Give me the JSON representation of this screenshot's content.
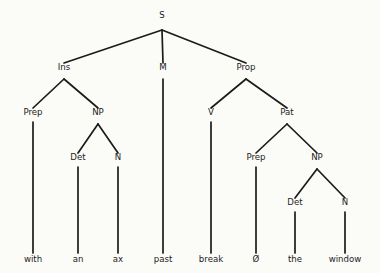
{
  "diagram": {
    "type": "syntax-tree",
    "background_color": "#fbfbf8",
    "line_color": "#1b1b1b",
    "text_color": "#1b1b1b",
    "sentence": "with an ax past break Ø the window",
    "nodes": [
      {
        "id": "s",
        "label": "S",
        "x": 162,
        "y": 18,
        "level": 0
      },
      {
        "id": "ins",
        "label": "Ins",
        "x": 64,
        "y": 70,
        "level": 1
      },
      {
        "id": "m",
        "label": "M",
        "x": 163,
        "y": 70,
        "level": 1
      },
      {
        "id": "prop",
        "label": "Prop",
        "x": 246,
        "y": 70,
        "level": 1
      },
      {
        "id": "prep1",
        "label": "Prep",
        "x": 33,
        "y": 115,
        "level": 2
      },
      {
        "id": "np1",
        "label": "NP",
        "x": 98,
        "y": 115,
        "level": 2
      },
      {
        "id": "v",
        "label": "V",
        "x": 211,
        "y": 115,
        "level": 2
      },
      {
        "id": "pat",
        "label": "Pat",
        "x": 287,
        "y": 115,
        "level": 2
      },
      {
        "id": "det1",
        "label": "Det",
        "x": 78,
        "y": 160,
        "level": 3
      },
      {
        "id": "n1",
        "label": "N",
        "x": 118,
        "y": 160,
        "level": 3
      },
      {
        "id": "prep2",
        "label": "Prep",
        "x": 256,
        "y": 160,
        "level": 3
      },
      {
        "id": "np2",
        "label": "NP",
        "x": 317,
        "y": 160,
        "level": 3
      },
      {
        "id": "det2",
        "label": "Det",
        "x": 295,
        "y": 205,
        "level": 4
      },
      {
        "id": "n2",
        "label": "N",
        "x": 345,
        "y": 205,
        "level": 4
      }
    ],
    "leaves": [
      {
        "id": "leaf-with",
        "label": "with",
        "x": 33,
        "y": 262,
        "parent": "prep1"
      },
      {
        "id": "leaf-an",
        "label": "an",
        "x": 78,
        "y": 262,
        "parent": "det1"
      },
      {
        "id": "leaf-ax",
        "label": "ax",
        "x": 118,
        "y": 262,
        "parent": "n1"
      },
      {
        "id": "leaf-past",
        "label": "past",
        "x": 163,
        "y": 262,
        "parent": "m"
      },
      {
        "id": "leaf-break",
        "label": "break",
        "x": 211,
        "y": 262,
        "parent": "v"
      },
      {
        "id": "leaf-null",
        "label": "Ø",
        "x": 256,
        "y": 262,
        "parent": "prep2"
      },
      {
        "id": "leaf-the",
        "label": "the",
        "x": 295,
        "y": 262,
        "parent": "det2"
      },
      {
        "id": "leaf-window",
        "label": "window",
        "x": 345,
        "y": 262,
        "parent": "n2"
      }
    ],
    "edges": [
      {
        "id": "edge-s-ins",
        "from": "s",
        "to": "ins",
        "x1": 162,
        "y1": 30,
        "x2": 64,
        "y2": 63
      },
      {
        "id": "edge-s-m",
        "from": "s",
        "to": "m",
        "x1": 162,
        "y1": 30,
        "x2": 163,
        "y2": 63
      },
      {
        "id": "edge-s-prop",
        "from": "s",
        "to": "prop",
        "x1": 162,
        "y1": 30,
        "x2": 246,
        "y2": 63
      },
      {
        "id": "edge-ins-prep1",
        "from": "ins",
        "to": "prep1",
        "x1": 64,
        "y1": 79,
        "x2": 33,
        "y2": 108
      },
      {
        "id": "edge-ins-np1",
        "from": "ins",
        "to": "np1",
        "x1": 64,
        "y1": 79,
        "x2": 98,
        "y2": 108
      },
      {
        "id": "edge-m-past",
        "from": "m",
        "to": "leaf-past",
        "x1": 163,
        "y1": 79,
        "x2": 163,
        "y2": 253
      },
      {
        "id": "edge-prop-v",
        "from": "prop",
        "to": "v",
        "x1": 246,
        "y1": 79,
        "x2": 211,
        "y2": 108
      },
      {
        "id": "edge-prop-pat",
        "from": "prop",
        "to": "pat",
        "x1": 246,
        "y1": 79,
        "x2": 287,
        "y2": 108
      },
      {
        "id": "edge-prep1-with",
        "from": "prep1",
        "to": "leaf-with",
        "x1": 33,
        "y1": 122,
        "x2": 33,
        "y2": 253
      },
      {
        "id": "edge-np1-det1",
        "from": "np1",
        "to": "det1",
        "x1": 98,
        "y1": 124,
        "x2": 78,
        "y2": 153
      },
      {
        "id": "edge-np1-n1",
        "from": "np1",
        "to": "n1",
        "x1": 98,
        "y1": 124,
        "x2": 118,
        "y2": 153
      },
      {
        "id": "edge-v-break",
        "from": "v",
        "to": "leaf-break",
        "x1": 211,
        "y1": 122,
        "x2": 211,
        "y2": 253
      },
      {
        "id": "edge-pat-prep2",
        "from": "pat",
        "to": "prep2",
        "x1": 287,
        "y1": 124,
        "x2": 256,
        "y2": 153
      },
      {
        "id": "edge-pat-np2",
        "from": "pat",
        "to": "np2",
        "x1": 287,
        "y1": 124,
        "x2": 317,
        "y2": 153
      },
      {
        "id": "edge-det1-an",
        "from": "det1",
        "to": "leaf-an",
        "x1": 78,
        "y1": 167,
        "x2": 78,
        "y2": 253
      },
      {
        "id": "edge-n1-ax",
        "from": "n1",
        "to": "leaf-ax",
        "x1": 118,
        "y1": 167,
        "x2": 118,
        "y2": 253
      },
      {
        "id": "edge-prep2-null",
        "from": "prep2",
        "to": "leaf-null",
        "x1": 256,
        "y1": 167,
        "x2": 256,
        "y2": 253
      },
      {
        "id": "edge-np2-det2",
        "from": "np2",
        "to": "det2",
        "x1": 317,
        "y1": 169,
        "x2": 295,
        "y2": 198
      },
      {
        "id": "edge-np2-n2",
        "from": "np2",
        "to": "n2",
        "x1": 317,
        "y1": 169,
        "x2": 345,
        "y2": 198
      },
      {
        "id": "edge-det2-the",
        "from": "det2",
        "to": "leaf-the",
        "x1": 295,
        "y1": 212,
        "x2": 295,
        "y2": 253
      },
      {
        "id": "edge-n2-window",
        "from": "n2",
        "to": "leaf-window",
        "x1": 345,
        "y1": 212,
        "x2": 345,
        "y2": 253
      }
    ]
  }
}
